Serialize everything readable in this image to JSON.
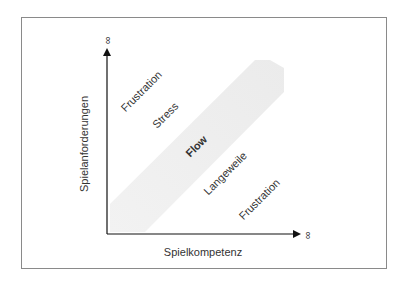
{
  "diagram": {
    "axes": {
      "x_label": "Spielkompetenz",
      "y_label": "Spielanforderungen",
      "x_end_symbol": "∞",
      "y_end_symbol": "∞"
    },
    "regions": {
      "flow": "Flow",
      "upper_near": "Stress",
      "upper_far": "Frustration",
      "lower_near": "Langeweile",
      "lower_far": "Frustration"
    },
    "colors": {
      "band": "#eeeeee",
      "axis": "#111111",
      "text": "#333333",
      "frame": "#8a8a8a"
    }
  }
}
